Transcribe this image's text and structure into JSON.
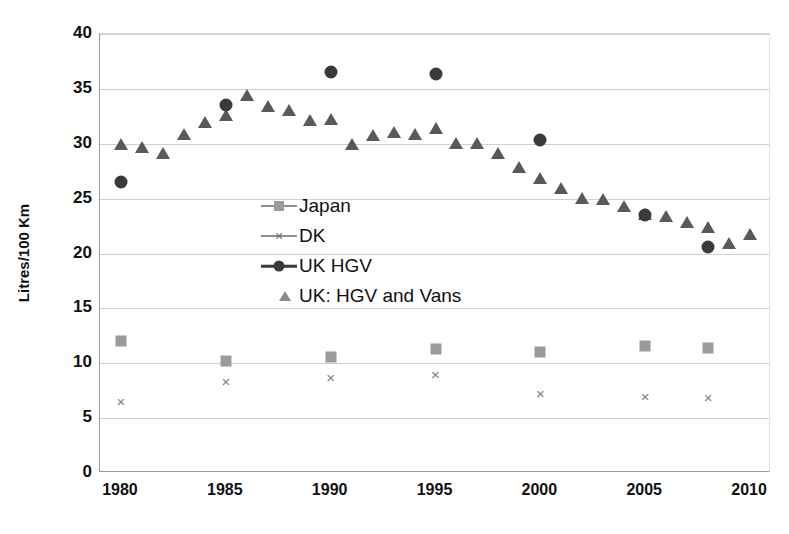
{
  "chart_data": {
    "type": "scatter",
    "title": "",
    "xlabel": "",
    "ylabel": "Litres/100 Km",
    "xlim": [
      1979,
      2011
    ],
    "ylim": [
      0,
      40
    ],
    "yticks": [
      0,
      5,
      10,
      15,
      20,
      25,
      30,
      35,
      40
    ],
    "xticks": [
      1980,
      1985,
      1990,
      1995,
      2000,
      2005,
      2010
    ],
    "grid": "horizontal",
    "legend_position": "inside-upper-left",
    "colors": {
      "japan": "#9b9b9b",
      "dk": "#7d7d7d",
      "uk_hgv": "#3a3a3a",
      "uk_hgv_vans": "#595959",
      "gridline": "#d0d0d0",
      "axis": "#9a9a9a",
      "text": "#111111"
    },
    "series": [
      {
        "name": "Japan",
        "marker": "square",
        "color": "#9b9b9b",
        "points": [
          {
            "x": 1980,
            "y": 12.0
          },
          {
            "x": 1985,
            "y": 10.2
          },
          {
            "x": 1990,
            "y": 10.6
          },
          {
            "x": 1995,
            "y": 11.3
          },
          {
            "x": 2000,
            "y": 11.0
          },
          {
            "x": 2005,
            "y": 11.6
          },
          {
            "x": 2008,
            "y": 11.4
          }
        ]
      },
      {
        "name": "DK",
        "marker": "x",
        "color": "#7d7d7d",
        "points": [
          {
            "x": 1980,
            "y": 6.5
          },
          {
            "x": 1985,
            "y": 8.3
          },
          {
            "x": 1990,
            "y": 8.7
          },
          {
            "x": 1995,
            "y": 8.9
          },
          {
            "x": 2000,
            "y": 7.2
          },
          {
            "x": 2005,
            "y": 6.9
          },
          {
            "x": 2008,
            "y": 6.8
          }
        ]
      },
      {
        "name": "UK HGV",
        "marker": "circle",
        "color": "#3a3a3a",
        "points": [
          {
            "x": 1980,
            "y": 26.5
          },
          {
            "x": 1985,
            "y": 33.5
          },
          {
            "x": 1990,
            "y": 36.5
          },
          {
            "x": 1995,
            "y": 36.4
          },
          {
            "x": 2000,
            "y": 30.3
          },
          {
            "x": 2005,
            "y": 23.5
          },
          {
            "x": 2008,
            "y": 20.6
          }
        ]
      },
      {
        "name": "UK: HGV and Vans",
        "marker": "triangle",
        "color": "#595959",
        "points": [
          {
            "x": 1980,
            "y": 30.0
          },
          {
            "x": 1981,
            "y": 29.7
          },
          {
            "x": 1982,
            "y": 29.2
          },
          {
            "x": 1983,
            "y": 30.9
          },
          {
            "x": 1984,
            "y": 32.0
          },
          {
            "x": 1985,
            "y": 32.6
          },
          {
            "x": 1986,
            "y": 34.4
          },
          {
            "x": 1987,
            "y": 33.4
          },
          {
            "x": 1988,
            "y": 33.1
          },
          {
            "x": 1989,
            "y": 32.2
          },
          {
            "x": 1990,
            "y": 32.3
          },
          {
            "x": 1991,
            "y": 30.0
          },
          {
            "x": 1992,
            "y": 30.8
          },
          {
            "x": 1993,
            "y": 31.1
          },
          {
            "x": 1994,
            "y": 30.9
          },
          {
            "x": 1995,
            "y": 31.4
          },
          {
            "x": 1996,
            "y": 30.1
          },
          {
            "x": 1997,
            "y": 30.1
          },
          {
            "x": 1998,
            "y": 29.2
          },
          {
            "x": 1999,
            "y": 27.9
          },
          {
            "x": 2000,
            "y": 26.9
          },
          {
            "x": 2001,
            "y": 26.0
          },
          {
            "x": 2002,
            "y": 25.1
          },
          {
            "x": 2003,
            "y": 25.0
          },
          {
            "x": 2004,
            "y": 24.3
          },
          {
            "x": 2005,
            "y": 23.6
          },
          {
            "x": 2006,
            "y": 23.4
          },
          {
            "x": 2007,
            "y": 22.9
          },
          {
            "x": 2008,
            "y": 22.4
          },
          {
            "x": 2009,
            "y": 21.0
          },
          {
            "x": 2010,
            "y": 21.8
          }
        ]
      }
    ]
  },
  "legend": {
    "items": [
      {
        "label": "Japan",
        "marker": "square-with-line"
      },
      {
        "label": "DK",
        "marker": "x-with-line"
      },
      {
        "label": "UK HGV",
        "marker": "circle-with-line"
      },
      {
        "label": "UK: HGV and Vans",
        "marker": "triangle"
      }
    ]
  },
  "axis": {
    "y_title": "Litres/100 Km",
    "y_tick_labels": [
      "0",
      "5",
      "10",
      "15",
      "20",
      "25",
      "30",
      "35",
      "40"
    ],
    "x_tick_labels": [
      "1980",
      "1985",
      "1990",
      "1995",
      "2000",
      "2005",
      "2010"
    ]
  }
}
